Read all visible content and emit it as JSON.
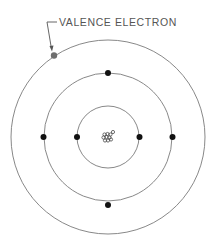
{
  "diagram": {
    "label": "VALENCE ELECTRON",
    "colors": {
      "orbit": "#7a7a7a",
      "electron": "#111111",
      "valence_electron": "#6e6e6e",
      "label": "#555555",
      "nucleus": "#333333"
    },
    "center": [
      108,
      137
    ],
    "shells": [
      {
        "name": "inner",
        "radius": 31,
        "electrons": 2
      },
      {
        "name": "middle",
        "radius": 64,
        "electrons": 4
      },
      {
        "name": "outer",
        "radius": 96,
        "electrons": 1
      }
    ]
  }
}
